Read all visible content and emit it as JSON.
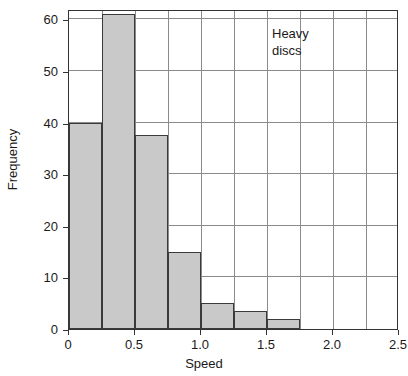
{
  "chart_data": {
    "type": "bar",
    "title": "",
    "subtitle": "",
    "xlabel": "Speed",
    "ylabel": "Frequency",
    "xlim": [
      0,
      2.5
    ],
    "ylim": [
      0,
      62
    ],
    "grid": true,
    "legend": "none",
    "bin_width": 0.25,
    "categories": [
      "0.00-0.25",
      "0.25-0.50",
      "0.50-0.75",
      "0.75-1.00",
      "1.00-1.25",
      "1.25-1.50",
      "1.50-1.75"
    ],
    "bin_starts": [
      0.0,
      0.25,
      0.5,
      0.75,
      1.0,
      1.25,
      1.5
    ],
    "values": [
      40,
      61,
      37.5,
      15,
      5,
      3.5,
      2
    ],
    "xticks": [
      0,
      0.5,
      1.0,
      1.5,
      2.0,
      2.5
    ],
    "xtick_labels": [
      "0",
      "0.5",
      "1.0",
      "1.5",
      "2.0",
      "2.5"
    ],
    "yticks": [
      0,
      10,
      20,
      30,
      40,
      50,
      60
    ],
    "ytick_labels": [
      "0",
      "10",
      "20",
      "30",
      "40",
      "50",
      "60"
    ],
    "gridlines_x": [
      0.25,
      0.5,
      0.75,
      1.0,
      1.25,
      1.5,
      1.75,
      2.0,
      2.25
    ],
    "gridlines_y": [
      10,
      20,
      30,
      40,
      50,
      60
    ],
    "annotations": [
      {
        "text_line1": "Heavy",
        "text_line2": "discs",
        "x": 1.55,
        "y": 57
      }
    ],
    "colors": {
      "bar_fill": "#c9c9c9",
      "bar_edge": "#3a3a3a",
      "grid": "#8a8a8a",
      "axis": "#333333",
      "text": "#1a1a1a",
      "background": "#ffffff"
    }
  }
}
